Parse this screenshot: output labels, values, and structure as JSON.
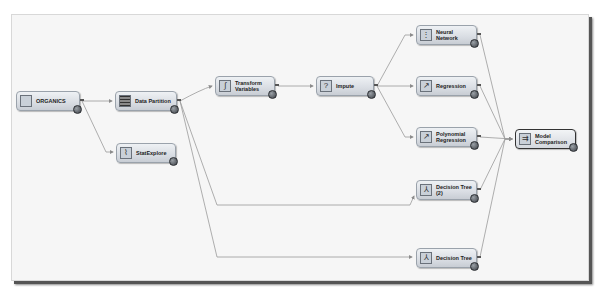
{
  "diagram": {
    "nodes": [
      {
        "id": "organics",
        "label": "ORGANICS",
        "icon": "data-source-icon"
      },
      {
        "id": "data-partition",
        "label": "Data Partition",
        "icon": "partition-grid-icon"
      },
      {
        "id": "statexplore",
        "label": "StatExplore",
        "icon": "statexplore-icon"
      },
      {
        "id": "transform-variables",
        "label": "Transform Variables",
        "icon": "transform-icon"
      },
      {
        "id": "impute",
        "label": "Impute",
        "icon": "impute-icon"
      },
      {
        "id": "neural-network",
        "label": "Neural Network",
        "icon": "neural-network-icon"
      },
      {
        "id": "regression",
        "label": "Regression",
        "icon": "regression-icon"
      },
      {
        "id": "polynomial-regression",
        "label": "Polynomial Regression",
        "icon": "regression-icon"
      },
      {
        "id": "decision-tree-2",
        "label": "Decision Tree (2)",
        "icon": "decision-tree-icon"
      },
      {
        "id": "decision-tree",
        "label": "Decision Tree",
        "icon": "decision-tree-icon"
      },
      {
        "id": "model-comparison",
        "label": "Model Comparison",
        "icon": "model-comparison-icon"
      }
    ],
    "edges": [
      [
        "organics",
        "data-partition"
      ],
      [
        "organics",
        "statexplore"
      ],
      [
        "data-partition",
        "transform-variables"
      ],
      [
        "data-partition",
        "decision-tree-2"
      ],
      [
        "data-partition",
        "decision-tree"
      ],
      [
        "transform-variables",
        "impute"
      ],
      [
        "impute",
        "neural-network"
      ],
      [
        "impute",
        "regression"
      ],
      [
        "impute",
        "polynomial-regression"
      ],
      [
        "neural-network",
        "model-comparison"
      ],
      [
        "regression",
        "model-comparison"
      ],
      [
        "polynomial-regression",
        "model-comparison"
      ],
      [
        "decision-tree-2",
        "model-comparison"
      ],
      [
        "decision-tree",
        "model-comparison"
      ]
    ],
    "colors": {
      "canvas": "#f6f6f6",
      "node_fill": "#d9dde3",
      "node_border": "#9aa2ab",
      "edge": "#8c8c8c",
      "selected_border": "#333333"
    }
  }
}
